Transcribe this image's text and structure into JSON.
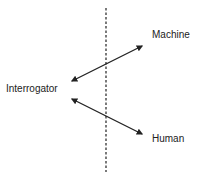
{
  "diagram": {
    "nodes": {
      "interrogator": "Interrogator",
      "machine": "Machine",
      "human": "Human"
    },
    "edges": [
      {
        "from": "interrogator",
        "to": "machine",
        "type": "bidirectional-arrow"
      },
      {
        "from": "interrogator",
        "to": "human",
        "type": "bidirectional-arrow"
      }
    ],
    "separator": "dashed-vertical-line",
    "colors": {
      "line": "#222222",
      "background": "#ffffff"
    }
  }
}
